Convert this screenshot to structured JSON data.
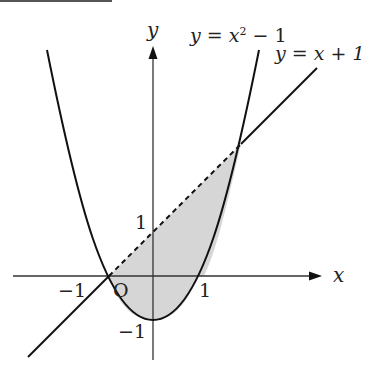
{
  "figure": {
    "axes": {
      "x_label": "x",
      "y_label": "y",
      "origin_label": "O"
    },
    "ticks": {
      "x_neg1": "−1",
      "x_pos1": "1",
      "y_pos1": "1",
      "y_neg1": "−1"
    },
    "curves": {
      "parabola": {
        "label_lhs": "y",
        "label_eq": " = ",
        "label_rhs_base": "x",
        "label_rhs_exp": "2",
        "label_rhs_tail": " − 1",
        "equation": "y = x^2 - 1"
      },
      "line": {
        "label": "y = x + 1",
        "equation": "y = x + 1"
      }
    },
    "shaded_region": "area between y = x + 1 and y = x^2 - 1 for -1 ≤ x ≤ 2",
    "intersections": [
      [
        -1,
        0
      ],
      [
        2,
        3
      ]
    ],
    "colors": {
      "stroke": "#1a1a1a",
      "fill": "#d4d4d4",
      "top_rule": "#555555"
    }
  }
}
